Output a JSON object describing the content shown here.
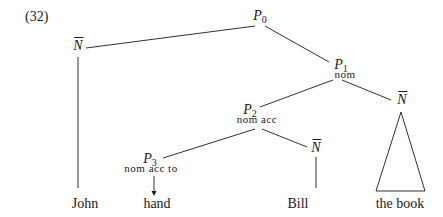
{
  "example_number": "(32)",
  "nodes": {
    "p0": {
      "label": "P",
      "sub": "0"
    },
    "p1": {
      "label": "P",
      "sub": "1",
      "features": "nom"
    },
    "p2": {
      "label": "P",
      "sub": "2",
      "features": "nom acc"
    },
    "p3": {
      "label": "P",
      "sub": "3",
      "features": "nom acc to"
    },
    "n_john": {
      "label": "N"
    },
    "n_book": {
      "label": "N"
    },
    "n_bill": {
      "label": "N"
    }
  },
  "leaves": {
    "john": "John",
    "hand": "hand",
    "bill": "Bill",
    "the_book": "the book"
  },
  "colors": {
    "line": "#1a1a1a",
    "background": "#ffffff"
  }
}
